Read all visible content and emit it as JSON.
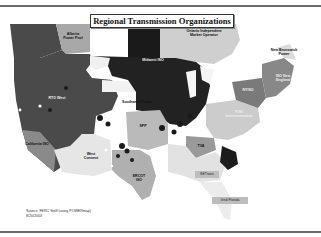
{
  "title": "Regional Transmission Organizations",
  "regions": [
    {
      "id": "alberta",
      "label": "Alberta Power Pool",
      "shade": "#a8a8a8"
    },
    {
      "id": "ontario",
      "label": "Ontario Independent Market Operator",
      "shade": "#cfcfcf"
    },
    {
      "id": "new-brunswick",
      "label": "New Brunswick Power",
      "shade": "#dcdcdc"
    },
    {
      "id": "rto-west",
      "label": "RTO West",
      "shade": "#4a4a4a"
    },
    {
      "id": "miso",
      "label": "Midwest ISO",
      "shade": "#222222"
    },
    {
      "id": "spp",
      "label": "SPP",
      "shade": "#bababa"
    },
    {
      "id": "california",
      "label": "California ISO",
      "shade": "#8a8a8a"
    },
    {
      "id": "westconnect",
      "label": "West Connect",
      "shade": "#e6e6e6"
    },
    {
      "id": "ercot",
      "label": "ERCOT ISO",
      "shade": "#b0b0b0"
    },
    {
      "id": "tva",
      "label": "TVA",
      "shade": "#9a9a9a"
    },
    {
      "id": "setrans",
      "label": "SETrans",
      "shade": "#e2e2e2"
    },
    {
      "id": "pjm",
      "label": "PJM Interconnection",
      "shade": "#cccccc"
    },
    {
      "id": "nyiso",
      "label": "NYISO",
      "shade": "#7a7a7a"
    },
    {
      "id": "iso-ne",
      "label": "ISO New England",
      "shade": "#888888"
    },
    {
      "id": "grid-florida",
      "label": "Grid Florida",
      "shade": "#c4c4c4"
    },
    {
      "id": "unlabeled-midwest",
      "label": "Southwest Power",
      "shade": "#555555"
    }
  ],
  "source": {
    "line1": "Source: FERC Staff (using POWERmap)",
    "line2": "8/20/2003"
  }
}
